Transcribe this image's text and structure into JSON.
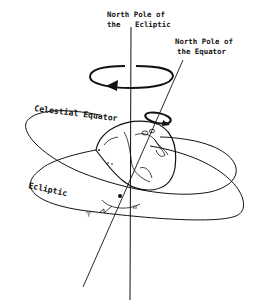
{
  "diagram": {
    "labels": {
      "ecliptic_pole_line1": "North Pole of",
      "ecliptic_pole_line2": "the",
      "ecliptic_pole_line2b": "Ecliptic",
      "equator_pole_line1": "North Pole of",
      "equator_pole_line2": "the Equator",
      "celestial_equator": "Celestial Equator",
      "ecliptic": "Ecliptic",
      "vernal_equinox_symbol": "♈",
      "ascending_node_symbol": "☊"
    },
    "colors": {
      "ink": "#111111",
      "background": "#ffffff"
    }
  }
}
